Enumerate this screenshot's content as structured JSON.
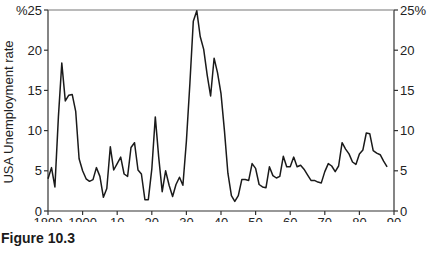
{
  "caption": "Figure 10.3",
  "chart_data": {
    "type": "line",
    "title": "",
    "xlabel": "",
    "ylabel": "USA Unemployment rate",
    "xlim": [
      1890,
      1990
    ],
    "ylim": [
      0,
      25
    ],
    "grid": false,
    "legend": null,
    "x_tick_labels": [
      "1890",
      "1900",
      "10",
      "20",
      "30",
      "40",
      "50",
      "60",
      "70",
      "80",
      "90"
    ],
    "x_tick_values": [
      1890,
      1900,
      1910,
      1920,
      1930,
      1940,
      1950,
      1960,
      1970,
      1980,
      1990
    ],
    "y_left_tick_labels": [
      "0",
      "5",
      "10",
      "15",
      "20",
      "%25"
    ],
    "y_right_tick_labels": [
      "0",
      "5",
      "10",
      "15",
      "20",
      "25%"
    ],
    "y_tick_values": [
      0,
      5,
      10,
      15,
      20,
      25
    ],
    "top_border": true,
    "series": [
      {
        "name": "USA Unemployment rate",
        "color": "#1a1a1a",
        "x": [
          1890,
          1891,
          1892,
          1893,
          1894,
          1895,
          1896,
          1897,
          1898,
          1899,
          1900,
          1901,
          1902,
          1903,
          1904,
          1905,
          1906,
          1907,
          1908,
          1909,
          1910,
          1911,
          1912,
          1913,
          1914,
          1915,
          1916,
          1917,
          1918,
          1919,
          1920,
          1921,
          1922,
          1923,
          1924,
          1925,
          1926,
          1927,
          1928,
          1929,
          1930,
          1931,
          1932,
          1933,
          1934,
          1935,
          1936,
          1937,
          1938,
          1939,
          1940,
          1941,
          1942,
          1943,
          1944,
          1945,
          1946,
          1947,
          1948,
          1949,
          1950,
          1951,
          1952,
          1953,
          1954,
          1955,
          1956,
          1957,
          1958,
          1959,
          1960,
          1961,
          1962,
          1963,
          1964,
          1965,
          1966,
          1967,
          1968,
          1969,
          1970,
          1971,
          1972,
          1973,
          1974,
          1975,
          1976,
          1977,
          1978,
          1979,
          1980,
          1981,
          1982,
          1983,
          1984,
          1985,
          1986,
          1987,
          1988
        ],
        "values": [
          4.0,
          5.4,
          3.0,
          11.7,
          18.4,
          13.7,
          14.4,
          14.5,
          12.4,
          6.5,
          5.0,
          4.0,
          3.7,
          3.9,
          5.4,
          4.3,
          1.7,
          2.8,
          8.0,
          5.1,
          5.9,
          6.7,
          4.6,
          4.3,
          7.9,
          8.5,
          5.1,
          4.6,
          1.4,
          1.4,
          5.2,
          11.7,
          6.7,
          2.4,
          5.0,
          3.2,
          1.8,
          3.3,
          4.2,
          3.2,
          8.7,
          15.9,
          23.6,
          24.9,
          21.7,
          20.1,
          16.9,
          14.3,
          19.0,
          17.2,
          14.6,
          9.9,
          4.7,
          1.9,
          1.2,
          1.9,
          3.9,
          3.9,
          3.8,
          5.9,
          5.3,
          3.3,
          3.0,
          2.9,
          5.5,
          4.4,
          4.1,
          4.3,
          6.8,
          5.5,
          5.5,
          6.7,
          5.5,
          5.7,
          5.2,
          4.5,
          3.8,
          3.8,
          3.6,
          3.5,
          4.9,
          5.9,
          5.6,
          4.9,
          5.6,
          8.5,
          7.7,
          7.1,
          6.1,
          5.8,
          7.1,
          7.6,
          9.7,
          9.6,
          7.5,
          7.2,
          7.0,
          6.2,
          5.5
        ]
      }
    ]
  }
}
